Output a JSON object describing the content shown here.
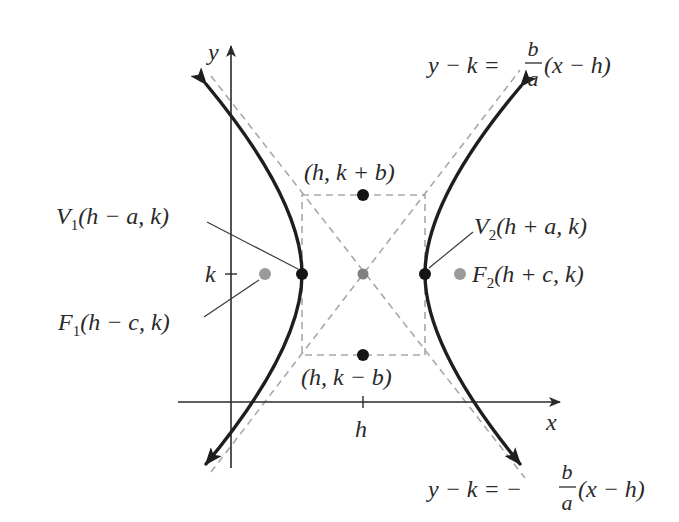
{
  "diagram": {
    "colors": {
      "curve": "#1e1e1e",
      "axis": "#2a2a2a",
      "dashed": "#a8a8a8",
      "vertex_point": "#141414",
      "focus_point": "#9a9a9a",
      "center_point": "#808080",
      "label": "#2a2a2a"
    },
    "axes": {
      "x_label": "x",
      "y_label": "y",
      "x_tick_label": "h",
      "y_tick_label": "k"
    },
    "asymptotes": {
      "positive": {
        "lhs": "y − k = ",
        "frac_num": "b",
        "frac_den": "a",
        "rhs": "(x − h)"
      },
      "negative": {
        "lhs": "y − k = −",
        "frac_num": "b",
        "frac_den": "a",
        "rhs": "(x − h)"
      }
    },
    "points": {
      "co_vertex_top": "(h, k + b)",
      "co_vertex_bottom": "(h, k − b)",
      "vertex_left": {
        "letter": "V",
        "sub": "1",
        "coords": "(h − a, k)"
      },
      "vertex_right": {
        "letter": "V",
        "sub": "2",
        "coords": "(h + a, k)"
      },
      "focus_left": {
        "letter": "F",
        "sub": "1",
        "coords": "(h − c, k)"
      },
      "focus_right": {
        "letter": "F",
        "sub": "2",
        "coords": "(h + c, k)"
      }
    }
  }
}
